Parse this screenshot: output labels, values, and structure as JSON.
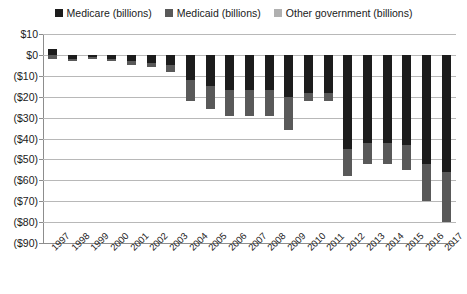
{
  "chart_data": {
    "type": "bar",
    "subtype": "stacked-column",
    "title": "",
    "xlabel": "",
    "ylabel": "",
    "ylim": [
      -90,
      10
    ],
    "ytick_step": 10,
    "grid": true,
    "legend_position": "top-center",
    "categories": [
      "1997",
      "1998",
      "1999",
      "2000",
      "2001",
      "2002",
      "2003",
      "2004",
      "2005",
      "2006",
      "2007",
      "2008",
      "2009",
      "2010",
      "2011",
      "2012",
      "2013",
      "2014",
      "2015",
      "2016",
      "2017"
    ],
    "ytick_labels": [
      "$10",
      "$0",
      "($10)",
      "($20)",
      "($30)",
      "($40)",
      "($50)",
      "($60)",
      "($70)",
      "($80)",
      "($90)"
    ],
    "ytick_values": [
      10,
      0,
      -10,
      -20,
      -30,
      -40,
      -50,
      -60,
      -70,
      -80,
      -90
    ],
    "series": [
      {
        "name": "Medicare (billions)",
        "color": "#1c1c1c",
        "values": [
          3,
          -2,
          -1,
          -2,
          -3,
          -4,
          -5,
          -12,
          -15,
          -17,
          -17,
          -17,
          -20,
          -18,
          -18,
          -45,
          -42,
          -42,
          -43,
          -52,
          -56
        ]
      },
      {
        "name": "Medicaid (billions)",
        "color": "#595959",
        "values": [
          -2,
          -1,
          -1,
          -1,
          -2,
          -2,
          -3,
          -10,
          -11,
          -12,
          -12,
          -12,
          -16,
          -4,
          -4,
          -13,
          -10,
          -10,
          -12,
          -18,
          -24
        ]
      },
      {
        "name": "Other government (billions)",
        "color": "#b0b0b0",
        "values": [
          0,
          0,
          0,
          0,
          0,
          0,
          0,
          0,
          0,
          0,
          0,
          0,
          0,
          0,
          0,
          0,
          0,
          0,
          0,
          0,
          0
        ]
      }
    ],
    "totals": [
      1,
      -3,
      -2,
      -3,
      -5,
      -6,
      -8,
      -22,
      -26,
      -29,
      -29,
      -29,
      -36,
      -22,
      -22,
      -58,
      -52,
      -52,
      -55,
      -70,
      -80
    ]
  },
  "legend": {
    "items": [
      {
        "label": "Medicare (billions)",
        "color": "#1c1c1c",
        "swatch_name": "legend-swatch-medicare"
      },
      {
        "label": "Medicaid (billions)",
        "color": "#595959",
        "swatch_name": "legend-swatch-medicaid"
      },
      {
        "label": "Other government (billions)",
        "color": "#b0b0b0",
        "swatch_name": "legend-swatch-other-government"
      }
    ]
  },
  "colors": {
    "medicare": "#1c1c1c",
    "medicaid": "#595959",
    "other_government": "#b0b0b0",
    "gridline": "#b8b8b8",
    "axis": "#8d8d8d",
    "text": "#1a1a1a",
    "background": "#ffffff"
  }
}
